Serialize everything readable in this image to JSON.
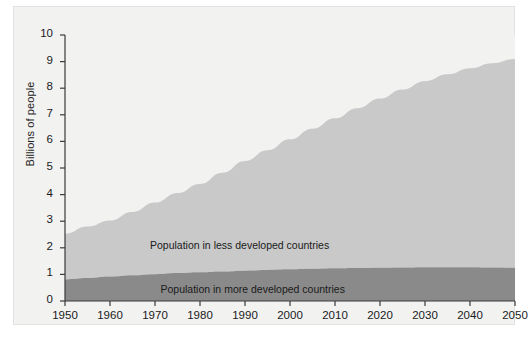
{
  "chart_data": {
    "type": "area",
    "title": "",
    "subtitle": "",
    "xlabel": "",
    "ylabel": "Billions of people",
    "stacked": true,
    "grid": false,
    "legend_position": "inline-annotations",
    "xlim": [
      1950,
      2050
    ],
    "ylim": [
      0,
      10
    ],
    "x_tick_labels": [
      "1950",
      "1960",
      "1970",
      "1980",
      "1990",
      "2000",
      "2010",
      "2020",
      "2030",
      "2040",
      "2050"
    ],
    "y_tick_labels": [
      "0",
      "1",
      "2",
      "3",
      "4",
      "5",
      "6",
      "7",
      "8",
      "9",
      "10"
    ],
    "x": [
      1950,
      1955,
      1960,
      1965,
      1970,
      1975,
      1980,
      1985,
      1990,
      1995,
      2000,
      2005,
      2010,
      2015,
      2020,
      2025,
      2030,
      2035,
      2040,
      2045,
      2050
    ],
    "series": [
      {
        "name": "Population in more developed countries",
        "color": "#8a8a8a",
        "values": [
          0.81,
          0.86,
          0.92,
          0.97,
          1.01,
          1.05,
          1.08,
          1.11,
          1.14,
          1.17,
          1.19,
          1.21,
          1.23,
          1.24,
          1.25,
          1.26,
          1.27,
          1.27,
          1.27,
          1.26,
          1.25
        ]
      },
      {
        "name": "Population in less developed countries",
        "color": "#c9c9c9",
        "values": [
          1.72,
          1.94,
          2.11,
          2.38,
          2.69,
          3.01,
          3.32,
          3.71,
          4.12,
          4.5,
          4.89,
          5.27,
          5.64,
          6.01,
          6.36,
          6.69,
          6.99,
          7.25,
          7.48,
          7.68,
          7.85
        ]
      }
    ],
    "totals": [
      2.53,
      2.8,
      3.03,
      3.35,
      3.7,
      4.06,
      4.4,
      4.82,
      5.26,
      5.67,
      6.08,
      6.48,
      6.87,
      7.25,
      7.61,
      7.95,
      8.26,
      8.52,
      8.75,
      8.94,
      9.1
    ],
    "annotations": [
      {
        "name": "less-developed-label",
        "text": "Population in less developed countries",
        "x": 1990,
        "y": 2.05
      },
      {
        "name": "more-developed-label",
        "text": "Population in more developed countries",
        "x": 1993,
        "y": 0.42
      }
    ],
    "colors": {
      "background": "#f2f2f1",
      "less_developed": "#c9c9c9",
      "more_developed": "#8a8a8a",
      "axis": "#3a3a3a",
      "text": "#1a1a1a"
    }
  }
}
